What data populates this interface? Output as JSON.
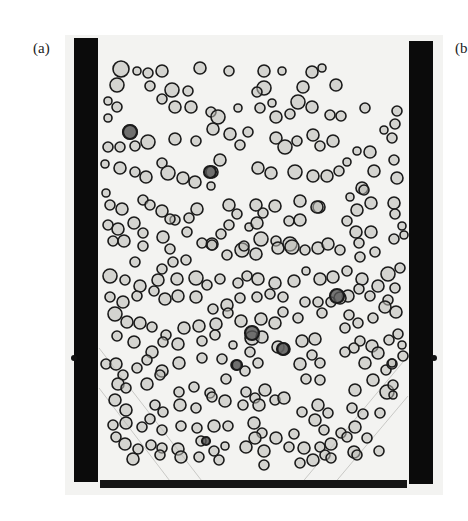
{
  "panels": {
    "a": {
      "label": "(a)"
    },
    "b": {
      "label": "(b"
    }
  },
  "photo": {
    "description": "Bubble column photograph: rising gas bubbles between two dark vertical walls with a dark base plate",
    "background_color": "#f1f1ef",
    "wall_color": "#0b0b0b",
    "bubble_stroke": "#1a1a1a",
    "bubble_fill": "#b9b9b5"
  },
  "bubbles": [
    [
      121,
      69,
      8
    ],
    [
      137,
      71,
      4
    ],
    [
      148,
      73,
      5
    ],
    [
      162,
      71,
      6
    ],
    [
      200,
      68,
      6
    ],
    [
      229,
      71,
      5
    ],
    [
      264,
      71,
      6
    ],
    [
      282,
      71,
      4
    ],
    [
      312,
      72,
      6
    ],
    [
      322,
      68,
      4
    ],
    [
      117,
      85,
      7
    ],
    [
      150,
      86,
      5
    ],
    [
      172,
      90,
      7
    ],
    [
      188,
      91,
      5
    ],
    [
      264,
      88,
      7
    ],
    [
      257,
      92,
      5
    ],
    [
      303,
      87,
      6
    ],
    [
      336,
      85,
      6
    ],
    [
      108,
      101,
      4
    ],
    [
      117,
      107,
      5
    ],
    [
      108,
      118,
      4
    ],
    [
      162,
      99,
      5
    ],
    [
      175,
      107,
      6
    ],
    [
      191,
      107,
      6
    ],
    [
      211,
      112,
      5
    ],
    [
      218,
      117,
      7
    ],
    [
      238,
      108,
      4
    ],
    [
      260,
      108,
      5
    ],
    [
      272,
      103,
      4
    ],
    [
      276,
      117,
      6
    ],
    [
      290,
      114,
      5
    ],
    [
      298,
      102,
      7
    ],
    [
      312,
      107,
      6
    ],
    [
      330,
      115,
      5
    ],
    [
      341,
      116,
      5
    ],
    [
      365,
      108,
      5
    ],
    [
      397,
      111,
      5
    ],
    [
      395,
      124,
      5
    ],
    [
      392,
      138,
      5
    ],
    [
      384,
      130,
      4
    ],
    [
      130,
      132,
      7
    ],
    [
      108,
      147,
      5
    ],
    [
      120,
      147,
      5
    ],
    [
      135,
      146,
      5
    ],
    [
      148,
      142,
      7
    ],
    [
      175,
      139,
      6
    ],
    [
      196,
      141,
      5
    ],
    [
      213,
      129,
      6
    ],
    [
      230,
      134,
      6
    ],
    [
      248,
      132,
      5
    ],
    [
      240,
      145,
      5
    ],
    [
      276,
      138,
      6
    ],
    [
      285,
      147,
      7
    ],
    [
      297,
      141,
      5
    ],
    [
      313,
      135,
      6
    ],
    [
      320,
      146,
      5
    ],
    [
      333,
      141,
      6
    ],
    [
      357,
      151,
      4
    ],
    [
      370,
      152,
      6
    ],
    [
      105,
      164,
      4
    ],
    [
      120,
      168,
      6
    ],
    [
      135,
      172,
      5
    ],
    [
      146,
      177,
      6
    ],
    [
      162,
      163,
      5
    ],
    [
      168,
      173,
      7
    ],
    [
      183,
      178,
      6
    ],
    [
      195,
      182,
      6
    ],
    [
      212,
      172,
      6
    ],
    [
      220,
      160,
      6
    ],
    [
      211,
      186,
      4
    ],
    [
      258,
      168,
      6
    ],
    [
      271,
      173,
      6
    ],
    [
      295,
      172,
      7
    ],
    [
      313,
      176,
      6
    ],
    [
      327,
      176,
      6
    ],
    [
      339,
      171,
      5
    ],
    [
      347,
      162,
      4
    ],
    [
      362,
      188,
      6
    ],
    [
      374,
      171,
      6
    ],
    [
      397,
      178,
      6
    ],
    [
      394,
      160,
      5
    ],
    [
      106,
      193,
      4
    ],
    [
      110,
      205,
      5
    ],
    [
      122,
      209,
      6
    ],
    [
      143,
      200,
      5
    ],
    [
      150,
      205,
      5
    ],
    [
      162,
      211,
      6
    ],
    [
      175,
      220,
      5
    ],
    [
      189,
      218,
      5
    ],
    [
      197,
      209,
      6
    ],
    [
      229,
      205,
      6
    ],
    [
      237,
      214,
      5
    ],
    [
      256,
      205,
      6
    ],
    [
      263,
      213,
      5
    ],
    [
      275,
      206,
      6
    ],
    [
      300,
      201,
      6
    ],
    [
      319,
      207,
      6
    ],
    [
      350,
      197,
      4
    ],
    [
      357,
      210,
      6
    ],
    [
      371,
      203,
      6
    ],
    [
      364,
      190,
      5
    ],
    [
      394,
      203,
      6
    ],
    [
      108,
      225,
      5
    ],
    [
      118,
      229,
      6
    ],
    [
      134,
      223,
      6
    ],
    [
      143,
      233,
      5
    ],
    [
      170,
      219,
      5
    ],
    [
      187,
      232,
      5
    ],
    [
      221,
      234,
      5
    ],
    [
      229,
      225,
      5
    ],
    [
      249,
      227,
      4
    ],
    [
      257,
      223,
      6
    ],
    [
      261,
      239,
      7
    ],
    [
      276,
      241,
      5
    ],
    [
      289,
      221,
      5
    ],
    [
      300,
      220,
      6
    ],
    [
      317,
      207,
      6
    ],
    [
      347,
      221,
      5
    ],
    [
      356,
      232,
      6
    ],
    [
      371,
      232,
      6
    ],
    [
      395,
      214,
      5
    ],
    [
      113,
      241,
      5
    ],
    [
      124,
      241,
      6
    ],
    [
      143,
      246,
      5
    ],
    [
      163,
      237,
      6
    ],
    [
      212,
      244,
      6
    ],
    [
      242,
      250,
      7
    ],
    [
      256,
      254,
      6
    ],
    [
      278,
      248,
      6
    ],
    [
      290,
      244,
      7
    ],
    [
      305,
      250,
      5
    ],
    [
      318,
      248,
      6
    ],
    [
      328,
      244,
      6
    ],
    [
      340,
      250,
      5
    ],
    [
      359,
      243,
      5
    ],
    [
      360,
      257,
      5
    ],
    [
      375,
      252,
      5
    ],
    [
      394,
      239,
      5
    ],
    [
      402,
      226,
      4
    ],
    [
      404,
      235,
      4
    ],
    [
      110,
      276,
      7
    ],
    [
      125,
      280,
      5
    ],
    [
      140,
      286,
      6
    ],
    [
      158,
      280,
      6
    ],
    [
      177,
      279,
      6
    ],
    [
      196,
      278,
      7
    ],
    [
      207,
      285,
      5
    ],
    [
      220,
      279,
      5
    ],
    [
      238,
      283,
      5
    ],
    [
      247,
      276,
      5
    ],
    [
      258,
      279,
      6
    ],
    [
      275,
      283,
      6
    ],
    [
      294,
      281,
      6
    ],
    [
      306,
      271,
      4
    ],
    [
      320,
      279,
      6
    ],
    [
      333,
      277,
      6
    ],
    [
      347,
      271,
      5
    ],
    [
      362,
      279,
      6
    ],
    [
      378,
      286,
      6
    ],
    [
      388,
      274,
      7
    ],
    [
      400,
      268,
      5
    ],
    [
      135,
      262,
      5
    ],
    [
      162,
      269,
      5
    ],
    [
      170,
      249,
      5
    ],
    [
      173,
      262,
      5
    ],
    [
      186,
      260,
      5
    ],
    [
      202,
      243,
      5
    ],
    [
      212,
      245,
      5
    ],
    [
      227,
      255,
      5
    ],
    [
      244,
      246,
      5
    ],
    [
      292,
      247,
      7
    ],
    [
      110,
      297,
      5
    ],
    [
      123,
      302,
      6
    ],
    [
      137,
      296,
      5
    ],
    [
      154,
      291,
      5
    ],
    [
      165,
      299,
      6
    ],
    [
      178,
      296,
      6
    ],
    [
      196,
      297,
      6
    ],
    [
      213,
      309,
      5
    ],
    [
      227,
      305,
      6
    ],
    [
      240,
      298,
      5
    ],
    [
      257,
      297,
      5
    ],
    [
      270,
      294,
      5
    ],
    [
      283,
      297,
      5
    ],
    [
      305,
      302,
      5
    ],
    [
      318,
      302,
      5
    ],
    [
      331,
      302,
      5
    ],
    [
      348,
      296,
      6
    ],
    [
      359,
      289,
      5
    ],
    [
      370,
      296,
      5
    ],
    [
      388,
      300,
      5
    ],
    [
      395,
      288,
      5
    ],
    [
      115,
      314,
      7
    ],
    [
      127,
      322,
      6
    ],
    [
      140,
      323,
      6
    ],
    [
      152,
      327,
      5
    ],
    [
      166,
      335,
      5
    ],
    [
      184,
      328,
      6
    ],
    [
      199,
      326,
      6
    ],
    [
      216,
      324,
      6
    ],
    [
      228,
      313,
      5
    ],
    [
      241,
      321,
      6
    ],
    [
      261,
      319,
      6
    ],
    [
      275,
      323,
      6
    ],
    [
      283,
      312,
      5
    ],
    [
      298,
      318,
      5
    ],
    [
      322,
      313,
      5
    ],
    [
      340,
      298,
      6
    ],
    [
      349,
      315,
      5
    ],
    [
      358,
      323,
      5
    ],
    [
      373,
      318,
      5
    ],
    [
      385,
      307,
      6
    ],
    [
      396,
      312,
      6
    ],
    [
      117,
      336,
      5
    ],
    [
      134,
      342,
      6
    ],
    [
      152,
      352,
      6
    ],
    [
      163,
      342,
      5
    ],
    [
      178,
      344,
      6
    ],
    [
      202,
      341,
      5
    ],
    [
      215,
      335,
      5
    ],
    [
      233,
      345,
      4
    ],
    [
      252,
      338,
      7
    ],
    [
      262,
      337,
      6
    ],
    [
      278,
      347,
      6
    ],
    [
      302,
      341,
      6
    ],
    [
      315,
      339,
      6
    ],
    [
      345,
      328,
      5
    ],
    [
      360,
      341,
      5
    ],
    [
      372,
      346,
      6
    ],
    [
      389,
      340,
      5
    ],
    [
      398,
      334,
      5
    ],
    [
      402,
      345,
      4
    ],
    [
      106,
      364,
      5
    ],
    [
      116,
      364,
      6
    ],
    [
      123,
      375,
      5
    ],
    [
      137,
      368,
      5
    ],
    [
      147,
      360,
      5
    ],
    [
      162,
      371,
      6
    ],
    [
      179,
      363,
      6
    ],
    [
      202,
      358,
      5
    ],
    [
      222,
      359,
      5
    ],
    [
      236,
      365,
      5
    ],
    [
      245,
      371,
      5
    ],
    [
      250,
      352,
      5
    ],
    [
      258,
      363,
      5
    ],
    [
      284,
      349,
      6
    ],
    [
      300,
      364,
      6
    ],
    [
      312,
      355,
      5
    ],
    [
      320,
      363,
      5
    ],
    [
      345,
      352,
      5
    ],
    [
      354,
      348,
      5
    ],
    [
      365,
      363,
      6
    ],
    [
      378,
      353,
      6
    ],
    [
      386,
      370,
      5
    ],
    [
      392,
      364,
      5
    ],
    [
      403,
      356,
      5
    ],
    [
      118,
      384,
      6
    ],
    [
      126,
      388,
      5
    ],
    [
      147,
      384,
      6
    ],
    [
      160,
      375,
      5
    ],
    [
      179,
      392,
      5
    ],
    [
      194,
      387,
      5
    ],
    [
      210,
      393,
      5
    ],
    [
      226,
      379,
      5
    ],
    [
      246,
      392,
      5
    ],
    [
      255,
      398,
      5
    ],
    [
      265,
      390,
      6
    ],
    [
      275,
      400,
      5
    ],
    [
      306,
      379,
      5
    ],
    [
      320,
      380,
      5
    ],
    [
      355,
      390,
      6
    ],
    [
      373,
      380,
      6
    ],
    [
      387,
      392,
      7
    ],
    [
      393,
      385,
      5
    ],
    [
      392,
      363,
      4
    ],
    [
      115,
      400,
      6
    ],
    [
      126,
      410,
      6
    ],
    [
      155,
      405,
      5
    ],
    [
      163,
      412,
      5
    ],
    [
      180,
      405,
      6
    ],
    [
      196,
      408,
      5
    ],
    [
      212,
      397,
      5
    ],
    [
      225,
      401,
      6
    ],
    [
      243,
      405,
      5
    ],
    [
      259,
      405,
      6
    ],
    [
      284,
      398,
      6
    ],
    [
      302,
      412,
      5
    ],
    [
      318,
      405,
      6
    ],
    [
      328,
      413,
      5
    ],
    [
      352,
      408,
      5
    ],
    [
      363,
      414,
      5
    ],
    [
      380,
      413,
      5
    ],
    [
      393,
      395,
      4
    ],
    [
      113,
      425,
      5
    ],
    [
      126,
      423,
      6
    ],
    [
      142,
      427,
      5
    ],
    [
      150,
      419,
      5
    ],
    [
      162,
      430,
      5
    ],
    [
      181,
      426,
      5
    ],
    [
      197,
      428,
      5
    ],
    [
      214,
      426,
      6
    ],
    [
      228,
      426,
      5
    ],
    [
      254,
      423,
      6
    ],
    [
      262,
      433,
      5
    ],
    [
      276,
      438,
      6
    ],
    [
      294,
      434,
      5
    ],
    [
      315,
      420,
      6
    ],
    [
      324,
      430,
      5
    ],
    [
      341,
      433,
      5
    ],
    [
      355,
      427,
      6
    ],
    [
      367,
      438,
      5
    ],
    [
      116,
      437,
      5
    ],
    [
      125,
      444,
      6
    ],
    [
      138,
      449,
      5
    ],
    [
      151,
      445,
      5
    ],
    [
      162,
      448,
      5
    ],
    [
      178,
      449,
      6
    ],
    [
      201,
      441,
      5
    ],
    [
      214,
      451,
      5
    ],
    [
      225,
      446,
      4
    ],
    [
      255,
      438,
      6
    ],
    [
      264,
      451,
      6
    ],
    [
      289,
      447,
      5
    ],
    [
      304,
      448,
      6
    ],
    [
      320,
      447,
      5
    ],
    [
      331,
      444,
      6
    ],
    [
      347,
      437,
      5
    ],
    [
      354,
      452,
      6
    ],
    [
      379,
      451,
      5
    ],
    [
      133,
      459,
      6
    ],
    [
      160,
      455,
      5
    ],
    [
      181,
      457,
      6
    ],
    [
      199,
      457,
      5
    ],
    [
      219,
      460,
      5
    ],
    [
      246,
      447,
      6
    ],
    [
      264,
      465,
      5
    ],
    [
      300,
      463,
      5
    ],
    [
      313,
      460,
      6
    ],
    [
      325,
      455,
      5
    ],
    [
      331,
      458,
      5
    ],
    [
      357,
      455,
      5
    ]
  ],
  "dark_bubbles": [
    [
      130,
      132,
      7
    ],
    [
      210,
      172,
      6
    ],
    [
      337,
      296,
      7
    ],
    [
      252,
      333,
      7
    ],
    [
      283,
      349,
      6
    ],
    [
      237,
      365,
      5
    ],
    [
      206,
      441,
      4
    ]
  ]
}
